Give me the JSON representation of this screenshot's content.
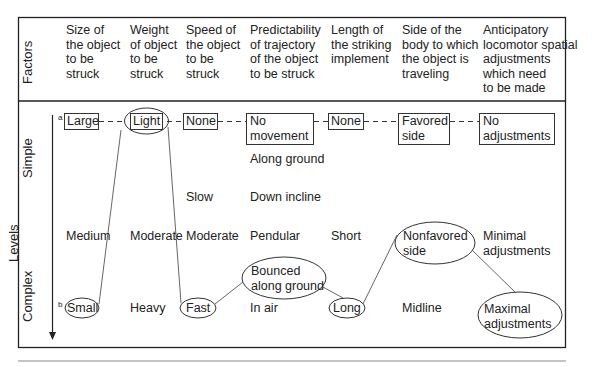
{
  "row_labels": {
    "factors": "Factors",
    "levels": "Levels",
    "simple": "Simple",
    "complex": "Complex"
  },
  "footnote_markers": {
    "a": "a",
    "b": "b"
  },
  "columns": [
    {
      "header": "Size of\nthe object\nto be\nstruck"
    },
    {
      "header": "Weight\nof object\nto be\nstruck"
    },
    {
      "header": "Speed of\nthe object\nto be\nstruck"
    },
    {
      "header": "Predictability\nof trajectory\nof the object\nto be struck"
    },
    {
      "header": "Length of\nthe striking\nimplement"
    },
    {
      "header": "Side of the\nbody to which\nthe object is\ntraveling"
    },
    {
      "header": "Anticipatory\nlocomotor spatial\nadjustments\nwhich need\nto be made"
    }
  ],
  "cells": {
    "size": {
      "simple": "Large",
      "medium": "Medium",
      "complex": "Small"
    },
    "weight": {
      "simple": "Light",
      "medium": "Moderate",
      "complex": "Heavy"
    },
    "speed": {
      "simple": "None",
      "slow": "Slow",
      "medium": "Moderate",
      "complex": "Fast"
    },
    "trajectory": {
      "simple": "No\nmovement",
      "along_ground": "Along ground",
      "down_incline": "Down incline",
      "medium": "Pendular",
      "bounced": "Bounced\nalong ground",
      "complex": "In air"
    },
    "length": {
      "simple": "None",
      "medium": "Short",
      "complex": "Long"
    },
    "side": {
      "simple": "Favored\nside",
      "medium": "Nonfavored\nside",
      "complex": "Midline"
    },
    "adjustments": {
      "simple": "No\nadjustments",
      "medium": "Minimal\nadjustments",
      "complex": "Maximal\nadjustments"
    }
  },
  "colors": {
    "line": "#333333",
    "border": "#222222",
    "rule": "#b0b0b0"
  }
}
